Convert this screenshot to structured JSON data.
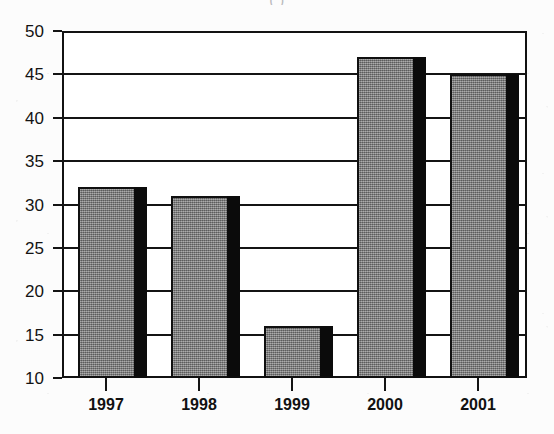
{
  "page": {
    "background_color": "#fcfcfc",
    "width": 554,
    "height": 434
  },
  "title_fragment": {
    "text": "(  )",
    "note": "cut-off title text at top edge of scan"
  },
  "chart_data": {
    "type": "bar",
    "title": "",
    "subtitle": "",
    "xlabel": "",
    "ylabel": "",
    "categories": [
      "1997",
      "1998",
      "1999",
      "2000",
      "2001"
    ],
    "values": [
      32,
      31,
      16,
      47,
      45
    ],
    "series": [
      {
        "name": "Value",
        "values": [
          32,
          31,
          16,
          47,
          45
        ]
      }
    ],
    "ylim": [
      10,
      50
    ],
    "ytick_labels": [
      "50",
      "45",
      "40",
      "35",
      "30",
      "25",
      "20",
      "15",
      "10"
    ],
    "ytick_values": [
      50,
      45,
      40,
      35,
      30,
      25,
      20,
      15,
      10
    ],
    "grid": true,
    "grid_axis": "y",
    "legend": false,
    "legend_position": "none",
    "bar_face_color": "#828282",
    "bar_shadow_color": "#0b0b0b",
    "axis_color": "#141414",
    "plot_background": "#ffffff"
  }
}
